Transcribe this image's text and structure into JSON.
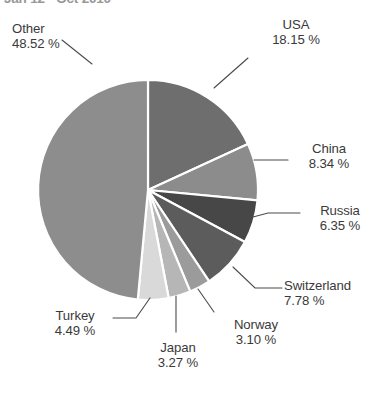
{
  "chart_data": {
    "type": "pie",
    "title": "Jan 12 - Oct 2010",
    "xlabel": "",
    "ylabel": "",
    "legend_position": "callout-labels",
    "grid": false,
    "unit": "%",
    "categories": [
      "USA",
      "China",
      "Russia",
      "Switzerland",
      "Norway",
      "Japan",
      "Turkey",
      "Other"
    ],
    "values": [
      18.15,
      8.34,
      6.35,
      7.78,
      3.1,
      3.27,
      4.49,
      48.52
    ],
    "labels": [
      "18.15 %",
      "8.34 %",
      "6.35 %",
      "7.78 %",
      "3.10 %",
      "3.27 %",
      "4.49 %",
      "48.52 %"
    ],
    "colors": [
      "#6e6e6e",
      "#8c8c8c",
      "#474747",
      "#5c5c5c",
      "#9b9b9b",
      "#b6b6b6",
      "#d9d9d9",
      "#8d8d8d"
    ],
    "start_angle_deg": 0,
    "direction": "clockwise",
    "separator_color": "#ffffff"
  },
  "slices": {
    "usa": {
      "name": "USA",
      "pct": "18.15 %"
    },
    "china": {
      "name": "China",
      "pct": "8.34 %"
    },
    "russia": {
      "name": "Russia",
      "pct": "6.35 %"
    },
    "switzerland": {
      "name": "Switzerland",
      "pct": "7.78 %"
    },
    "norway": {
      "name": "Norway",
      "pct": "3.10 %"
    },
    "japan": {
      "name": "Japan",
      "pct": "3.27 %"
    },
    "turkey": {
      "name": "Turkey",
      "pct": "4.49 %"
    },
    "other": {
      "name": "Other",
      "pct": "48.52 %"
    }
  },
  "title": {
    "text": "Jan 12 - Oct 2010"
  }
}
